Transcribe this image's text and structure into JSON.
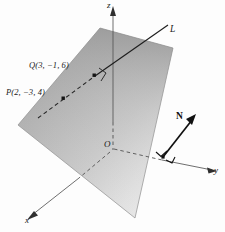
{
  "figure": {
    "kind": "3d-plane-and-line-diagram",
    "background_color": "#fdfdfd"
  },
  "axes": {
    "z": {
      "label": "z",
      "arrow": "up"
    },
    "y": {
      "label": "y",
      "arrow": "right-down"
    },
    "x": {
      "label": "x",
      "arrow": "left-down"
    },
    "origin": {
      "label": "O"
    }
  },
  "plane": {
    "fill_light": "#e2e2e2",
    "fill_dark": "#9b9b9b",
    "edge_color": "#8f8f8f"
  },
  "line": {
    "label": "L",
    "style": "solid-inside-plane-dashed-behind",
    "color": "#2b2b2b"
  },
  "points": [
    {
      "name": "Q",
      "label": "Q(3, −1, 6)",
      "coords": [
        3,
        -1,
        6
      ]
    },
    {
      "name": "P",
      "label": "P(2, −3, 4)",
      "coords": [
        2,
        -3,
        4
      ]
    }
  ],
  "normal_vector": {
    "label": "N",
    "color": "#111111",
    "right_angle_marks": 2
  }
}
